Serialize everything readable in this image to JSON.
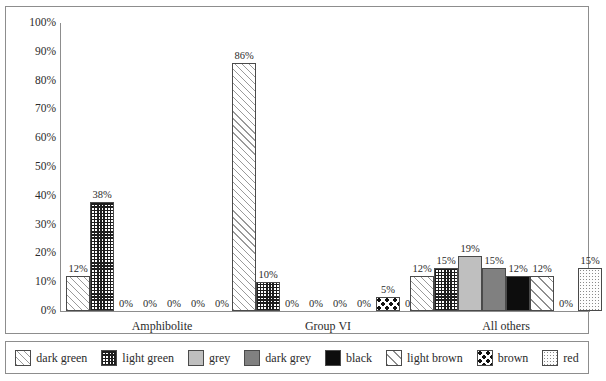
{
  "chart_data": {
    "type": "bar",
    "title": "",
    "xlabel": "",
    "ylabel": "",
    "ylim": [
      0,
      100
    ],
    "grid": false,
    "legend_position": "bottom",
    "categories": [
      "Amphibolite",
      "Group VI",
      "All others"
    ],
    "series": [
      {
        "name": "dark green",
        "key": "darkgreen",
        "values": [
          12,
          86,
          12
        ],
        "labels": [
          "12%",
          "86%",
          "12%"
        ]
      },
      {
        "name": "light green",
        "key": "lightgreen",
        "values": [
          38,
          10,
          15
        ],
        "labels": [
          "38%",
          "10%",
          "15%"
        ]
      },
      {
        "name": "grey",
        "key": "grey",
        "values": [
          0,
          0,
          19
        ],
        "labels": [
          "0%",
          "0%",
          "19%"
        ]
      },
      {
        "name": "dark grey",
        "key": "darkgrey",
        "values": [
          0,
          0,
          15
        ],
        "labels": [
          "0%",
          "0%",
          "15%"
        ]
      },
      {
        "name": "black",
        "key": "black",
        "values": [
          0,
          0,
          12
        ],
        "labels": [
          "0%",
          "0%",
          "12%"
        ]
      },
      {
        "name": "light brown",
        "key": "lightbrown",
        "values": [
          0,
          0,
          12
        ],
        "labels": [
          "0%",
          "0%",
          "12%"
        ]
      },
      {
        "name": "brown",
        "key": "brown",
        "values": [
          0,
          5,
          0
        ],
        "labels": [
          "0%",
          "5%",
          "0%"
        ]
      },
      {
        "name": "red",
        "key": "red",
        "values": [
          0,
          0,
          15
        ],
        "labels": [
          "0%",
          "0%",
          "15%"
        ]
      }
    ],
    "y_ticks": [
      "0%",
      "10%",
      "20%",
      "30%",
      "40%",
      "50%",
      "60%",
      "70%",
      "80%",
      "90%",
      "100%"
    ],
    "y_tick_values": [
      0,
      10,
      20,
      30,
      40,
      50,
      60,
      70,
      80,
      90,
      100
    ]
  },
  "legend": {
    "items": [
      {
        "label": "dark green",
        "key": "darkgreen"
      },
      {
        "label": "light green",
        "key": "lightgreen"
      },
      {
        "label": "grey",
        "key": "grey"
      },
      {
        "label": "dark grey",
        "key": "darkgrey"
      },
      {
        "label": "black",
        "key": "black"
      },
      {
        "label": "light brown",
        "key": "lightbrown"
      },
      {
        "label": "brown",
        "key": "brown"
      },
      {
        "label": "red",
        "key": "red"
      }
    ]
  },
  "colors": {
    "axis": "#8d8d8d",
    "text": "#2b2b2b",
    "bar_border": "#4a4a4a",
    "grey": "#bfbfbf",
    "dark_grey": "#808080",
    "black": "#0d0d0d",
    "background": "#ffffff"
  }
}
